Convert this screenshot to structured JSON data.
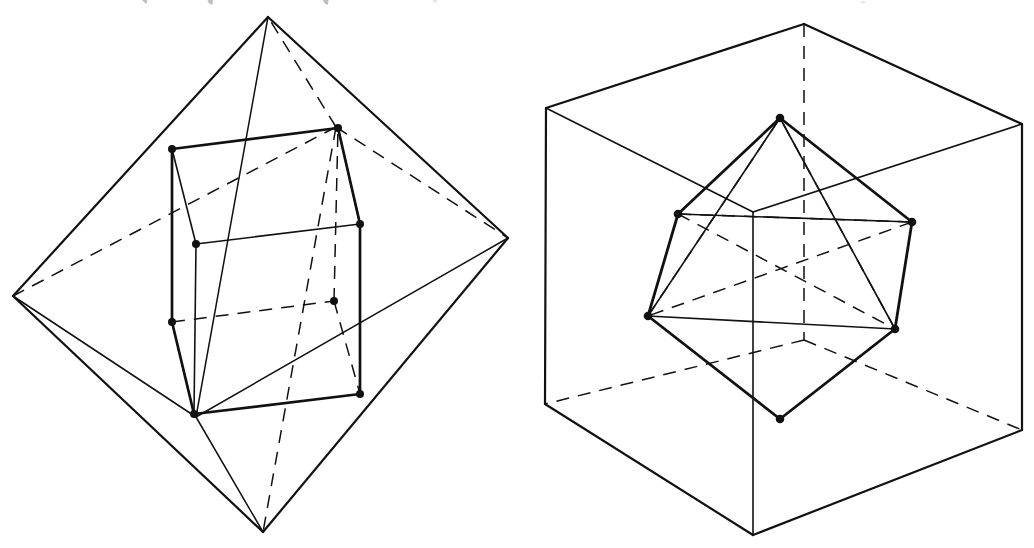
{
  "document": {
    "kind": "geometry-illustration",
    "background_color": "#ffffff",
    "ink_color": "#111111",
    "width": 1034,
    "height": 548,
    "figure_count": 2
  },
  "artifacts": {
    "top_crop_note": "faint descender remnants of a cropped text line along the very top edge",
    "ghost_marks": [
      {
        "x": 142,
        "y": 0,
        "w": 5,
        "h": 4
      },
      {
        "x": 207,
        "y": 0,
        "w": 6,
        "h": 5
      },
      {
        "x": 323,
        "y": 0,
        "w": 6,
        "h": 5
      },
      {
        "x": 433,
        "y": 1,
        "w": 4,
        "h": 3
      },
      {
        "x": 861,
        "y": 2,
        "w": 4,
        "h": 3
      }
    ]
  },
  "figures": [
    {
      "id": "left-figure",
      "name": "cube-inscribed-in-octahedron",
      "outer_solid": "octahedron",
      "inner_solid": "cube",
      "stroke_outer": 2.1,
      "stroke_inner": 2.6,
      "stroke_thin": 1.5,
      "stroke_hidden": 1.5,
      "dash_pattern": "13 9",
      "vertex_radius": 4.0,
      "octahedron_vertices": {
        "top": [
          268,
          17
        ],
        "bottom": [
          263,
          532
        ],
        "left": [
          13,
          296
        ],
        "right": [
          508,
          238
        ],
        "front": [
          196,
          417
        ],
        "back": [
          336,
          127
        ]
      },
      "cube_vertices": {
        "top_front_left": [
          172,
          149
        ],
        "top_front_right": [
          338,
          128
        ],
        "top_back_right": [
          360,
          224
        ],
        "top_back_left": [
          196,
          244
        ],
        "bottom_front_left": [
          172,
          322
        ],
        "bottom_front_right": [
          334,
          301
        ],
        "bottom_back_right": [
          360,
          394
        ],
        "bottom_back_left": [
          194,
          414
        ]
      },
      "visible_vertex_dots": [
        [
          172,
          149
        ],
        [
          338,
          128
        ],
        [
          360,
          224
        ],
        [
          196,
          244
        ],
        [
          172,
          322
        ],
        [
          334,
          301
        ],
        [
          360,
          394
        ],
        [
          194,
          414
        ]
      ]
    },
    {
      "id": "right-figure",
      "name": "octahedron-inscribed-in-cube",
      "outer_solid": "cube",
      "inner_solid": "octahedron",
      "stroke_outer": 2.1,
      "stroke_inner": 2.7,
      "stroke_thin": 1.5,
      "stroke_hidden": 1.5,
      "dash_pattern": "13 9",
      "vertex_radius": 4.3,
      "cube_vertices": {
        "front_top_left": [
          546,
          108
        ],
        "front_top_right": [
          1022,
          124
        ],
        "back_top_left": [
          804,
          24
        ],
        "back_top_right": [
          1022,
          124
        ],
        "top_near": [
          753,
          212
        ],
        "front_bottom_left": [
          545,
          404
        ],
        "front_bottom": [
          753,
          535
        ],
        "front_bottom_right": [
          1022,
          430
        ],
        "back_bottom": [
          804,
          340
        ]
      },
      "octahedron_vertices": {
        "apex_top": [
          780,
          118
        ],
        "apex_bottom": [
          780,
          419
        ],
        "equator_back_left": [
          678,
          214
        ],
        "equator_back_right": [
          912,
          222
        ],
        "equator_front_left": [
          648,
          316
        ],
        "equator_front_right": [
          895,
          329
        ]
      },
      "visible_vertex_dots": [
        [
          780,
          118
        ],
        [
          780,
          419
        ],
        [
          678,
          214
        ],
        [
          912,
          222
        ],
        [
          648,
          316
        ],
        [
          895,
          329
        ]
      ]
    }
  ]
}
